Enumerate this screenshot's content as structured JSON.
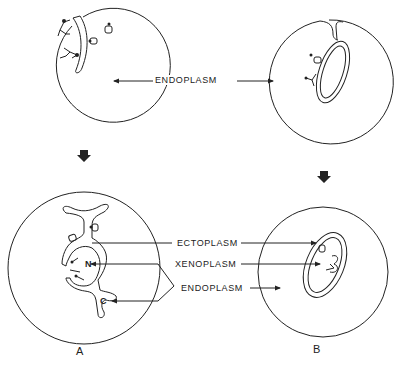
{
  "labels": {
    "endoplasm_top": "ENDOPLASM",
    "ectoplasm": "ECTOPLASM",
    "xenoplasm": "XENOPLASM",
    "endoplasm_bottom": "ENDOPLASM",
    "nucleus": "N",
    "c_marker": "C"
  },
  "panels": {
    "a": "A",
    "b": "B"
  },
  "colors": {
    "stroke": "#222222",
    "background": "#ffffff"
  }
}
